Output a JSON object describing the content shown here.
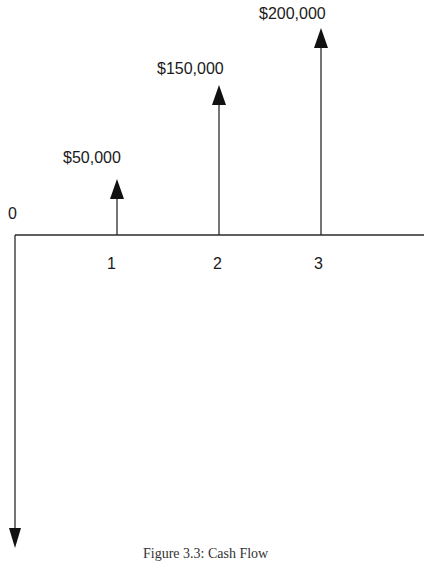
{
  "diagram": {
    "type": "cash-flow-diagram",
    "origin_label": "0",
    "periods": [
      "1",
      "2",
      "3"
    ],
    "inflows": [
      {
        "period": "1",
        "label": "$50,000",
        "amount": 50000
      },
      {
        "period": "2",
        "label": "$150,000",
        "amount": 150000
      },
      {
        "period": "3",
        "label": "$200,000",
        "amount": 200000
      }
    ],
    "outflow": {
      "period": "0",
      "direction": "down",
      "label": ""
    },
    "caption": "Figure 3.3: Cash Flow"
  },
  "colors": {
    "line": "#2a2a2a",
    "arrowhead": "#111111",
    "background": "#ffffff"
  }
}
